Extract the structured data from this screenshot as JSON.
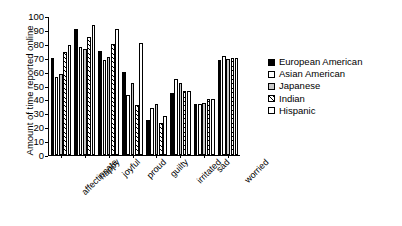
{
  "chart_data": {
    "type": "bar",
    "title": "",
    "xlabel": "",
    "ylabel": "Amount of time reported online",
    "ylim": [
      0,
      100
    ],
    "yticks": [
      0,
      10,
      20,
      30,
      40,
      50,
      60,
      70,
      80,
      90,
      100
    ],
    "grid": false,
    "legend_position": "right",
    "categories": [
      "affectionate",
      "happy",
      "joyful",
      "proud",
      "guilty",
      "irritated",
      "sad",
      "worried"
    ],
    "series": [
      {
        "name": "European American",
        "fill": "black",
        "values": [
          70,
          90.5,
          75,
          60,
          25.5,
          44.5,
          37,
          68.5
        ]
      },
      {
        "name": "Asian American",
        "fill": "white",
        "values": [
          56,
          77.5,
          68,
          43.5,
          33.5,
          54.5,
          36.5,
          71
        ]
      },
      {
        "name": "Japanese",
        "fill": "light-gray",
        "values": [
          58,
          76,
          70.5,
          51.5,
          37,
          52,
          37.5,
          69
        ]
      },
      {
        "name": "Indian",
        "fill": "hatched",
        "values": [
          74,
          85,
          80,
          36,
          23,
          46,
          40,
          70
        ]
      },
      {
        "name": "Hispanic",
        "fill": "white",
        "values": [
          79.5,
          93.5,
          91,
          80.5,
          28,
          46,
          40,
          70
        ]
      }
    ]
  },
  "legend": {
    "items": [
      {
        "label": "European American",
        "swatch": "black"
      },
      {
        "label": "Asian American",
        "swatch": "white"
      },
      {
        "label": "Japanese",
        "swatch": "light-gray"
      },
      {
        "label": "Indian",
        "swatch": "hatched"
      },
      {
        "label": "Hispanic",
        "swatch": "white"
      }
    ]
  }
}
